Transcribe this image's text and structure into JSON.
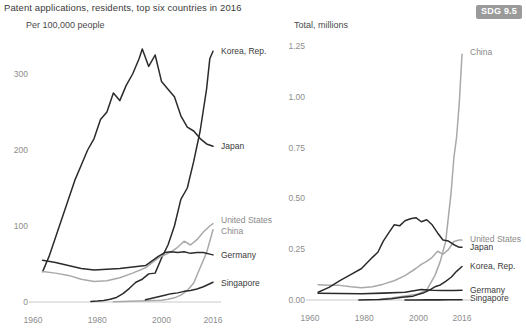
{
  "figure": {
    "title": "Patent applications, residents, top six countries in 2016",
    "badge": "SDG 9.5"
  },
  "chart_data": [
    {
      "type": "line",
      "panel": "left",
      "title": "Per 100,000 people",
      "xlabel": "",
      "ylabel": "Per 100,000 people",
      "xlim": [
        1960,
        2016
      ],
      "ylim": [
        0,
        340
      ],
      "xticks": [
        1960,
        1980,
        2000,
        2016
      ],
      "yticks": [
        0,
        100,
        200,
        300
      ],
      "xticklabels": [
        "1960",
        "1980",
        "2000",
        "2016"
      ],
      "yticklabels": [
        "0",
        "100",
        "200",
        "300"
      ],
      "grid": false,
      "legend_position": "right-inline",
      "series": [
        {
          "name": "Korea, Rep.",
          "color": "#2b2b2b",
          "width": 1.5,
          "label_x": 2017,
          "label_y": 330,
          "x": [
            1978,
            1980,
            1982,
            1984,
            1986,
            1988,
            1990,
            1992,
            1994,
            1996,
            1998,
            2000,
            2002,
            2004,
            2006,
            2008,
            2010,
            2012,
            2014,
            2015,
            2016
          ],
          "y": [
            0.8,
            1.2,
            2,
            3.5,
            6,
            11,
            18,
            26,
            30,
            37,
            38,
            58,
            75,
            100,
            135,
            150,
            185,
            225,
            280,
            320,
            330
          ]
        },
        {
          "name": "Japan",
          "color": "#2b2b2b",
          "width": 1.5,
          "label_x": 2017,
          "label_y": 205,
          "x": [
            1963,
            1965,
            1967,
            1969,
            1971,
            1973,
            1975,
            1977,
            1979,
            1981,
            1983,
            1985,
            1987,
            1989,
            1991,
            1993,
            1994,
            1996,
            1998,
            2000,
            2002,
            2004,
            2006,
            2008,
            2010,
            2012,
            2014,
            2016
          ],
          "y": [
            40,
            60,
            85,
            110,
            135,
            160,
            180,
            200,
            215,
            240,
            250,
            275,
            265,
            285,
            300,
            320,
            333,
            310,
            325,
            290,
            280,
            270,
            245,
            230,
            225,
            215,
            208,
            205
          ]
        },
        {
          "name": "United States",
          "color": "#a9a9a9",
          "width": 1.5,
          "label_x": 2017,
          "label_y": 108,
          "x": [
            1963,
            1967,
            1971,
            1975,
            1979,
            1983,
            1987,
            1991,
            1995,
            1999,
            2001,
            2003,
            2005,
            2007,
            2009,
            2011,
            2013,
            2015,
            2016
          ],
          "y": [
            40,
            38,
            35,
            30,
            27,
            28,
            32,
            38,
            45,
            58,
            62,
            66,
            72,
            80,
            75,
            82,
            92,
            100,
            103
          ]
        },
        {
          "name": "China",
          "color": "#a9a9a9",
          "width": 1.5,
          "label_x": 2017,
          "label_y": 93,
          "x": [
            1985,
            1990,
            1995,
            2000,
            2002,
            2004,
            2006,
            2008,
            2010,
            2012,
            2014,
            2016
          ],
          "y": [
            0.3,
            0.9,
            1.5,
            2.2,
            3.5,
            5.5,
            9,
            15,
            25,
            45,
            65,
            95
          ]
        },
        {
          "name": "Germany",
          "color": "#2b2b2b",
          "width": 1.5,
          "label_x": 2017,
          "label_y": 62,
          "x": [
            1963,
            1967,
            1971,
            1975,
            1979,
            1983,
            1987,
            1991,
            1995,
            1999,
            2001,
            2003,
            2005,
            2007,
            2009,
            2011,
            2013,
            2015,
            2016
          ],
          "y": [
            55,
            52,
            48,
            44,
            42,
            43,
            44,
            46,
            48,
            60,
            65,
            66,
            65,
            66,
            64,
            65,
            65,
            63,
            62
          ]
        },
        {
          "name": "Singapore",
          "color": "#2b2b2b",
          "width": 1.5,
          "label_x": 2017,
          "label_y": 25,
          "x": [
            1995,
            1997,
            1999,
            2001,
            2003,
            2005,
            2007,
            2009,
            2011,
            2013,
            2015,
            2016
          ],
          "y": [
            3,
            5,
            7,
            9,
            11,
            12,
            14,
            15,
            17,
            20,
            24,
            26
          ]
        }
      ]
    },
    {
      "type": "line",
      "panel": "right",
      "title": "Total, millions",
      "xlabel": "",
      "ylabel": "Total, millions",
      "xlim": [
        1960,
        2016
      ],
      "ylim": [
        0,
        1.3
      ],
      "xticks": [
        1960,
        1980,
        2000,
        2016
      ],
      "yticks": [
        0,
        0.25,
        0.5,
        0.75,
        1.0,
        1.25
      ],
      "xticklabels": [
        "1960",
        "1980",
        "2000",
        "2016"
      ],
      "yticklabels": [
        "0.00",
        "0.25",
        "0.50",
        "0.75",
        "1.00",
        "1.25"
      ],
      "grid": false,
      "legend_position": "right-inline",
      "series": [
        {
          "name": "China",
          "color": "#a9a9a9",
          "width": 1.5,
          "label_x": 2017,
          "label_y": 1.22,
          "x": [
            1985,
            1990,
            1995,
            2000,
            2003,
            2006,
            2008,
            2010,
            2012,
            2013,
            2014,
            2015,
            2016
          ],
          "y": [
            0.003,
            0.01,
            0.02,
            0.03,
            0.05,
            0.12,
            0.19,
            0.29,
            0.53,
            0.7,
            0.8,
            0.97,
            1.21
          ]
        },
        {
          "name": "United States",
          "color": "#a9a9a9",
          "width": 1.5,
          "label_x": 2017,
          "label_y": 0.3,
          "x": [
            1963,
            1967,
            1971,
            1975,
            1979,
            1983,
            1987,
            1991,
            1995,
            1999,
            2001,
            2003,
            2005,
            2007,
            2009,
            2011,
            2013,
            2015,
            2016
          ],
          "y": [
            0.075,
            0.073,
            0.072,
            0.065,
            0.06,
            0.065,
            0.078,
            0.095,
            0.12,
            0.155,
            0.175,
            0.19,
            0.21,
            0.24,
            0.225,
            0.248,
            0.288,
            0.295,
            0.295
          ]
        },
        {
          "name": "Japan",
          "color": "#2b2b2b",
          "width": 1.5,
          "label_x": 2017,
          "label_y": 0.26,
          "x": [
            1963,
            1967,
            1971,
            1975,
            1979,
            1983,
            1985,
            1987,
            1989,
            1991,
            1993,
            1995,
            1997,
            1999,
            2001,
            2003,
            2005,
            2007,
            2009,
            2011,
            2013,
            2015,
            2016
          ],
          "y": [
            0.038,
            0.062,
            0.095,
            0.125,
            0.155,
            0.21,
            0.235,
            0.29,
            0.33,
            0.37,
            0.365,
            0.39,
            0.4,
            0.405,
            0.385,
            0.395,
            0.37,
            0.33,
            0.295,
            0.29,
            0.272,
            0.259,
            0.26
          ]
        },
        {
          "name": "Korea, Rep.",
          "color": "#2b2b2b",
          "width": 1.5,
          "label_x": 2017,
          "label_y": 0.165,
          "x": [
            1978,
            1982,
            1986,
            1990,
            1994,
            1998,
            2000,
            2002,
            2004,
            2006,
            2008,
            2010,
            2012,
            2014,
            2016
          ],
          "y": [
            0.0003,
            0.0008,
            0.002,
            0.006,
            0.013,
            0.019,
            0.028,
            0.036,
            0.049,
            0.065,
            0.074,
            0.092,
            0.112,
            0.141,
            0.165
          ]
        },
        {
          "name": "Germany",
          "color": "#2b2b2b",
          "width": 1.6,
          "label_x": 2017,
          "label_y": 0.048,
          "x": [
            1963,
            1971,
            1979,
            1987,
            1995,
            2001,
            2005,
            2009,
            2013,
            2016
          ],
          "y": [
            0.033,
            0.032,
            0.031,
            0.034,
            0.038,
            0.052,
            0.048,
            0.047,
            0.047,
            0.048
          ]
        },
        {
          "name": "Singapore",
          "color": "#2b2b2b",
          "width": 1.6,
          "label_x": 2017,
          "label_y": 0.012,
          "x": [
            1995,
            1999,
            2003,
            2007,
            2011,
            2014,
            2016
          ],
          "y": [
            0.0001,
            0.0003,
            0.0006,
            0.0008,
            0.001,
            0.0013,
            0.0015
          ]
        }
      ]
    }
  ]
}
